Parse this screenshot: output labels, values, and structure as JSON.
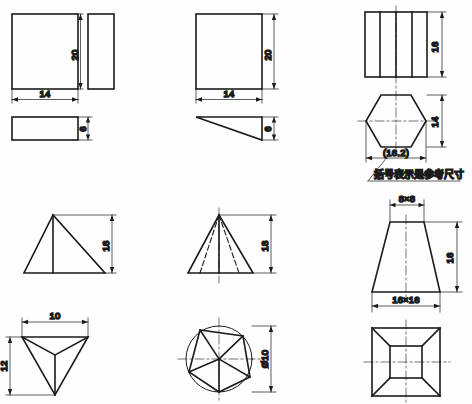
{
  "drawing": {
    "title": "Orthographic projection exercise sheet",
    "background_color": "#fefefe",
    "line_color": "#1b1b1b",
    "note": "括号表示是参考尺寸",
    "units": "mm"
  },
  "views": [
    {
      "id": "rect-block",
      "name": "rectangular-block",
      "position": "top-left",
      "front_view": {
        "shape": "rectangle",
        "width_label": "14",
        "height_label": "20"
      },
      "side_view": {
        "shape": "rectangle",
        "width_label": "6"
      },
      "top_view": {
        "shape": "rectangle",
        "width_label": "14",
        "height_label": "6"
      },
      "dimensions": [
        {
          "value": "20",
          "orientation": "vertical"
        },
        {
          "value": "14",
          "orientation": "horizontal"
        },
        {
          "value": "6",
          "orientation": "vertical"
        }
      ]
    },
    {
      "id": "wedge-block",
      "name": "wedge-block",
      "position": "top-center",
      "front_view": {
        "shape": "rectangle",
        "width_label": "14",
        "height_label": "20"
      },
      "top_view": {
        "shape": "right-triangle",
        "height_label": "6"
      },
      "dimensions": [
        {
          "value": "20",
          "orientation": "vertical"
        },
        {
          "value": "14",
          "orientation": "horizontal"
        },
        {
          "value": "6",
          "orientation": "vertical"
        }
      ]
    },
    {
      "id": "hex-prism",
      "name": "hexagonal-prism",
      "position": "top-right",
      "front_view": {
        "shape": "rectangle-with-edges",
        "height_label": "16"
      },
      "top_view": {
        "shape": "hexagon",
        "across_corners_label": "(16.2)",
        "across_flats_label": "14"
      },
      "dimensions": [
        {
          "value": "16",
          "orientation": "vertical"
        },
        {
          "value": "14",
          "orientation": "vertical"
        },
        {
          "value": "(16.2)",
          "orientation": "horizontal"
        }
      ]
    },
    {
      "id": "tetrahedron",
      "name": "triangular-pyramid",
      "position": "bottom-left",
      "front_view": {
        "shape": "triangle",
        "height_label": "18"
      },
      "top_view": {
        "shape": "triangle",
        "width_label": "10",
        "height_label": "12"
      },
      "dimensions": [
        {
          "value": "18",
          "orientation": "vertical"
        },
        {
          "value": "10",
          "orientation": "horizontal"
        },
        {
          "value": "12",
          "orientation": "vertical"
        }
      ]
    },
    {
      "id": "pent-pyramid",
      "name": "pentagonal-pyramid",
      "position": "bottom-center",
      "front_view": {
        "shape": "triangle-with-hidden-edges",
        "height_label": "18"
      },
      "top_view": {
        "shape": "pentagon-in-circle",
        "diameter_label": "Ø10"
      },
      "dimensions": [
        {
          "value": "18",
          "orientation": "vertical"
        },
        {
          "value": "Ø10",
          "orientation": "vertical"
        }
      ]
    },
    {
      "id": "square-frustum",
      "name": "square-frustum",
      "position": "bottom-right",
      "front_view": {
        "shape": "trapezoid",
        "top_label": "8×8",
        "bottom_label": "16×16",
        "height_label": "16"
      },
      "top_view": {
        "shape": "nested-squares"
      },
      "dimensions": [
        {
          "value": "8×8",
          "orientation": "horizontal"
        },
        {
          "value": "16",
          "orientation": "vertical"
        },
        {
          "value": "16×16",
          "orientation": "horizontal"
        }
      ]
    }
  ],
  "labels": {
    "d20_a": "20",
    "d14_a": "14",
    "d6_a": "6",
    "d20_b": "20",
    "d14_b": "14",
    "d6_b": "6",
    "d16_hex": "16",
    "d14_hex": "14",
    "d162_hex": "(16.2)",
    "note_hex": "括号表示是参考尺寸",
    "d18_tetra": "18",
    "d10_tetra": "10",
    "d12_tetra": "12",
    "d18_pent": "18",
    "ddia_pent": "Ø10",
    "d8x8": "8×8",
    "d16_frustum": "16",
    "d16x16": "16×16"
  }
}
